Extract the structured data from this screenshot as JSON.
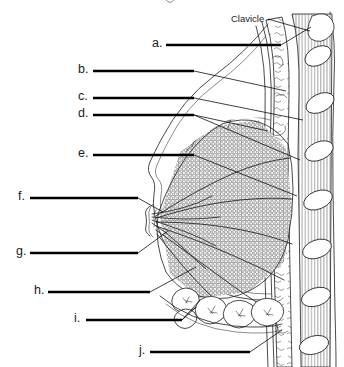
{
  "figure": {
    "kind": "anatomical-labeling-worksheet",
    "background_color": "#ffffff",
    "ink_color": "#1d1d1d",
    "rule_color": "#000000"
  },
  "title": {
    "text": "",
    "visible": false,
    "note": "a faint partially cropped mark appears at the very top edge"
  },
  "named_labels": [
    {
      "id": "clavicle",
      "text": "Clavicle",
      "text_x": 231,
      "text_y": 22,
      "leader": "M 268 19 L 310 31",
      "points_to": "clavicle bone cross-section, upper right"
    }
  ],
  "answer_blanks": [
    {
      "id": "a",
      "letter": "a.",
      "letter_x": 152,
      "letter_y": 47,
      "rule_x1": 166,
      "rule_x2": 281,
      "rule_y": 45,
      "leader": "M 281 45 L 311 27"
    },
    {
      "id": "b",
      "letter": "b.",
      "letter_x": 78,
      "letter_y": 73,
      "rule_x1": 93,
      "rule_x2": 194,
      "rule_y": 71,
      "leader": "M 194 71 L 286 91"
    },
    {
      "id": "c",
      "letter": "c.",
      "letter_x": 78,
      "letter_y": 100,
      "rule_x1": 93,
      "rule_x2": 194,
      "rule_y": 98,
      "leader": "M 194 98 L 303 120"
    },
    {
      "id": "d",
      "letter": "d.",
      "letter_x": 78,
      "letter_y": 117,
      "rule_x1": 93,
      "rule_x2": 194,
      "rule_y": 115,
      "leader": "M 194 115 L 300 160"
    },
    {
      "id": "e",
      "letter": "e.",
      "letter_x": 78,
      "letter_y": 157,
      "rule_x1": 93,
      "rule_x2": 194,
      "rule_y": 155,
      "leader": "M 194 155 L 297 196"
    },
    {
      "id": "f",
      "letter": "f.",
      "letter_x": 18,
      "letter_y": 200,
      "rule_x1": 30,
      "rule_x2": 138,
      "rule_y": 198,
      "leader": "M 138 198 L 163 212"
    },
    {
      "id": "g",
      "letter": "g.",
      "letter_x": 16,
      "letter_y": 255,
      "rule_x1": 30,
      "rule_x2": 138,
      "rule_y": 253,
      "leader": "M 138 253 L 168 231"
    },
    {
      "id": "h",
      "letter": "h.",
      "letter_x": 34,
      "letter_y": 294,
      "rule_x1": 48,
      "rule_x2": 150,
      "rule_y": 292,
      "leader": "M 150 292 L 196 267"
    },
    {
      "id": "i",
      "letter": "i.",
      "letter_x": 74,
      "letter_y": 322,
      "rule_x1": 86,
      "rule_x2": 182,
      "rule_y": 320,
      "leader": "M 182 320 L 196 307"
    },
    {
      "id": "j",
      "letter": "j.",
      "letter_x": 139,
      "letter_y": 354,
      "rule_x1": 150,
      "rule_x2": 250,
      "rule_y": 352,
      "leader": "M 250 352 L 282 330"
    }
  ],
  "structure_notes": {
    "breast_outline": "skin profile curving from upper chest out to nipple apex near x=152,y=216 then down and back to chest wall",
    "glandular_tissue": "stippled lobule masses filling the breast body",
    "adipose_tissue": "rounded fat lobules along the inferior margin",
    "chest_wall": "vertical band of pectoral and intercostal muscle striations on the right",
    "ribs": "seven white oval rib cross-sections descending along the right edge",
    "clavicle": "irregular bone cross-section at the top right"
  }
}
